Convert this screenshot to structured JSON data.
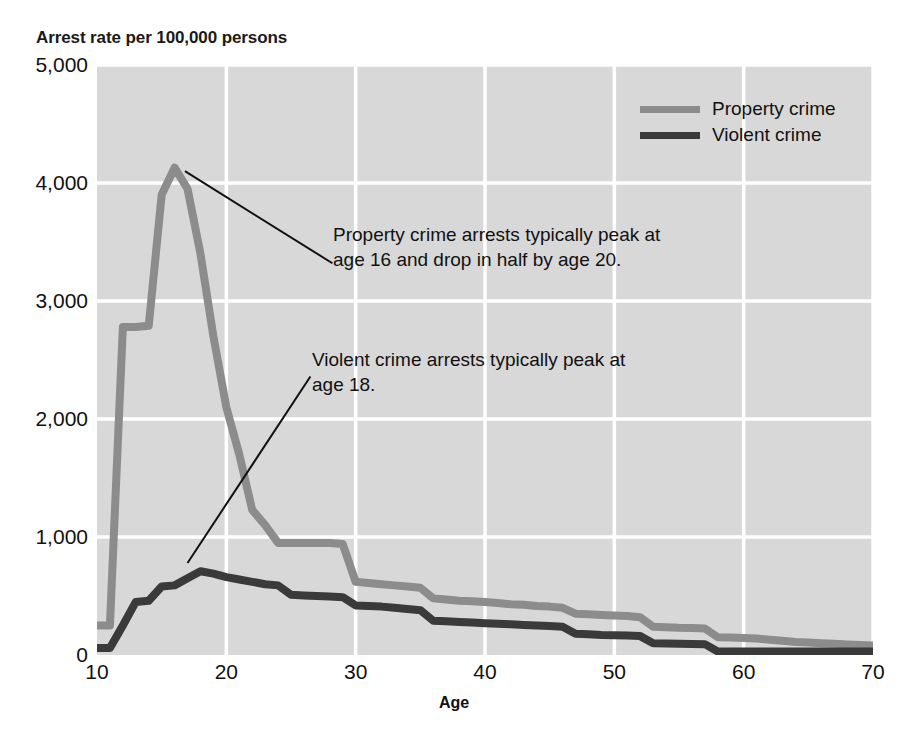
{
  "chart_data": {
    "type": "line",
    "title": "Arrest rate per 100,000 persons",
    "xlabel": "Age",
    "ylabel": "Arrest rate per 100,000 persons",
    "xlim": [
      10,
      70
    ],
    "ylim": [
      0,
      5000
    ],
    "xticks": [
      "10",
      "20",
      "30",
      "40",
      "50",
      "60",
      "70"
    ],
    "xtick_values": [
      10,
      20,
      30,
      40,
      50,
      60,
      70
    ],
    "yticks": [
      "0",
      "1,000",
      "2,000",
      "3,000",
      "4,000",
      "5,000"
    ],
    "ytick_values": [
      0,
      1000,
      2000,
      3000,
      4000,
      5000
    ],
    "grid": true,
    "grid_color": "#ffffff",
    "plot_bg": "#d8d8d8",
    "legend_position": "top-right",
    "x": [
      10,
      11,
      12,
      13,
      14,
      15,
      16,
      17,
      18,
      19,
      20,
      21,
      22,
      23,
      24,
      25,
      26,
      27,
      28,
      29,
      30,
      31,
      32,
      33,
      34,
      35,
      36,
      37,
      38,
      39,
      40,
      41,
      42,
      43,
      44,
      45,
      46,
      47,
      48,
      49,
      50,
      51,
      52,
      53,
      54,
      55,
      56,
      57,
      58,
      59,
      60,
      61,
      62,
      63,
      64,
      65,
      66,
      67,
      68,
      69,
      70
    ],
    "series": [
      {
        "name": "Property crime",
        "color": "#8c8c8c",
        "values": [
          250,
          250,
          2780,
          2780,
          2790,
          3900,
          4130,
          3950,
          3400,
          2700,
          2100,
          1700,
          1230,
          1100,
          950,
          950,
          950,
          950,
          950,
          940,
          620,
          610,
          600,
          590,
          580,
          570,
          480,
          470,
          460,
          455,
          450,
          440,
          430,
          425,
          415,
          410,
          400,
          350,
          345,
          340,
          335,
          330,
          320,
          240,
          235,
          230,
          228,
          225,
          150,
          148,
          145,
          140,
          130,
          120,
          110,
          105,
          100,
          95,
          90,
          85,
          80
        ]
      },
      {
        "name": "Violent crime",
        "color": "#3a3a3a",
        "values": [
          60,
          60,
          250,
          450,
          460,
          580,
          590,
          650,
          710,
          690,
          660,
          640,
          620,
          600,
          590,
          510,
          505,
          500,
          495,
          490,
          420,
          415,
          410,
          400,
          390,
          380,
          290,
          285,
          280,
          275,
          270,
          265,
          260,
          255,
          250,
          245,
          240,
          180,
          175,
          170,
          168,
          165,
          160,
          100,
          98,
          96,
          94,
          92,
          30,
          30,
          30,
          30,
          30,
          30,
          30,
          30,
          30,
          30,
          30,
          30,
          30
        ]
      }
    ],
    "annotations": [
      {
        "id": "property-annotation",
        "text": "Property crime arrests typically peak at\nage 16 and drop in half by age 20.",
        "leader_from": [
          16.8,
          4100
        ],
        "leader_to": [
          28.2,
          3320
        ]
      },
      {
        "id": "violent-annotation",
        "text": "Violent crime arrests typically peak at\nage 18.",
        "leader_from": [
          17.0,
          780
        ],
        "leader_to": [
          26.5,
          2360
        ]
      }
    ]
  },
  "legend": {
    "items": [
      {
        "label": "Property crime",
        "color": "#8c8c8c"
      },
      {
        "label": "Violent crime",
        "color": "#3a3a3a"
      }
    ]
  }
}
